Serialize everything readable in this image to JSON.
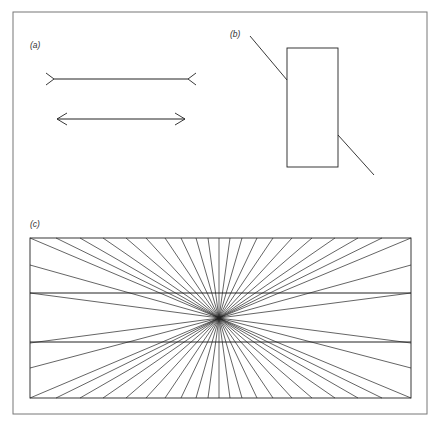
{
  "figure": {
    "frame": {
      "x": 13,
      "y": 12,
      "w": 414,
      "h": 402,
      "stroke": "#777777"
    },
    "ink": "#222222",
    "panels": {
      "a": {
        "label": "(a)",
        "label_pos": [
          30,
          48
        ],
        "shaft1": {
          "x1": 54,
          "x2": 188,
          "y": 79,
          "fins": "outward"
        },
        "shaft2": {
          "x1": 57,
          "x2": 185,
          "y": 119,
          "fins": "inward"
        }
      },
      "b": {
        "label": "(b)",
        "label_pos": [
          230,
          37
        ],
        "rect": {
          "x": 287,
          "y": 48,
          "w": 51,
          "h": 119
        },
        "line_upper": [
          [
            250,
            36
          ],
          [
            287,
            80
          ]
        ],
        "line_lower": [
          [
            338,
            135
          ],
          [
            374,
            175
          ]
        ]
      },
      "c": {
        "label": "(c)",
        "label_pos": [
          30,
          227
        ],
        "rect": {
          "x": 30,
          "y": 238,
          "w": 381,
          "h": 160
        },
        "horizontal_lines_y": [
          293,
          342
        ],
        "center": [
          219,
          318
        ],
        "top_offsets_x": [
          -189,
          -163,
          -139,
          -116,
          -93,
          -73,
          -54,
          -38,
          -23,
          -11,
          0,
          11,
          23,
          38,
          54,
          73,
          93,
          116,
          139,
          163,
          192
        ],
        "side_offsets_y": [
          -53,
          -25,
          25,
          50
        ]
      }
    }
  }
}
